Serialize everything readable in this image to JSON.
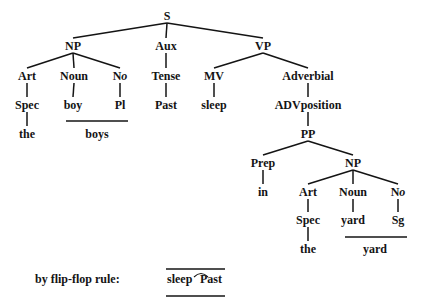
{
  "tree": {
    "nodes": [
      {
        "id": "S",
        "label": "S",
        "x": 167,
        "y": 20
      },
      {
        "id": "NP1",
        "label": "NP",
        "x": 73,
        "y": 50
      },
      {
        "id": "Aux",
        "label": "Aux",
        "x": 166,
        "y": 50
      },
      {
        "id": "VP",
        "label": "VP",
        "x": 263,
        "y": 50
      },
      {
        "id": "Art1",
        "label": "Art",
        "x": 27,
        "y": 80
      },
      {
        "id": "Noun1",
        "label": "Noun",
        "x": 74,
        "y": 80
      },
      {
        "id": "No1",
        "label": "No",
        "x": 120,
        "y": 80,
        "italic_o": true
      },
      {
        "id": "Tense",
        "label": "Tense",
        "x": 166,
        "y": 80
      },
      {
        "id": "MV",
        "label": "MV",
        "x": 214,
        "y": 80
      },
      {
        "id": "Adverbial",
        "label": "Adverbial",
        "x": 308,
        "y": 80
      },
      {
        "id": "Spec1",
        "label": "Spec",
        "x": 27,
        "y": 109
      },
      {
        "id": "boy",
        "label": "boy",
        "x": 73,
        "y": 109
      },
      {
        "id": "Pl",
        "label": "Pl",
        "x": 120,
        "y": 109
      },
      {
        "id": "Past",
        "label": "Past",
        "x": 166,
        "y": 109
      },
      {
        "id": "sleep",
        "label": "sleep",
        "x": 214,
        "y": 109
      },
      {
        "id": "ADVposition",
        "label": "ADVposition",
        "x": 308,
        "y": 109
      },
      {
        "id": "the1",
        "label": "the",
        "x": 27,
        "y": 138
      },
      {
        "id": "PP",
        "label": "PP",
        "x": 308,
        "y": 138
      },
      {
        "id": "Prep",
        "label": "Prep",
        "x": 263,
        "y": 167
      },
      {
        "id": "NP2",
        "label": "NP",
        "x": 353,
        "y": 167
      },
      {
        "id": "in",
        "label": "in",
        "x": 263,
        "y": 196
      },
      {
        "id": "Art2",
        "label": "Art",
        "x": 308,
        "y": 196
      },
      {
        "id": "Noun2",
        "label": "Noun",
        "x": 353,
        "y": 196
      },
      {
        "id": "No2",
        "label": "No",
        "x": 398,
        "y": 196,
        "italic_o": true
      },
      {
        "id": "Spec2",
        "label": "Spec",
        "x": 308,
        "y": 224
      },
      {
        "id": "yard1",
        "label": "yard",
        "x": 353,
        "y": 224
      },
      {
        "id": "Sg",
        "label": "Sg",
        "x": 398,
        "y": 224
      },
      {
        "id": "the2",
        "label": "the",
        "x": 308,
        "y": 253
      }
    ],
    "edges": [
      [
        "S",
        "NP1"
      ],
      [
        "S",
        "Aux"
      ],
      [
        "S",
        "VP"
      ],
      [
        "NP1",
        "Art1"
      ],
      [
        "NP1",
        "Noun1"
      ],
      [
        "NP1",
        "No1"
      ],
      [
        "Aux",
        "Tense"
      ],
      [
        "VP",
        "MV"
      ],
      [
        "VP",
        "Adverbial"
      ],
      [
        "Art1",
        "Spec1"
      ],
      [
        "Noun1",
        "boy"
      ],
      [
        "No1",
        "Pl"
      ],
      [
        "Tense",
        "Past"
      ],
      [
        "MV",
        "sleep"
      ],
      [
        "Adverbial",
        "ADVposition"
      ],
      [
        "Spec1",
        "the1"
      ],
      [
        "ADVposition",
        "PP"
      ],
      [
        "PP",
        "Prep"
      ],
      [
        "PP",
        "NP2"
      ],
      [
        "Prep",
        "in"
      ],
      [
        "NP2",
        "Art2"
      ],
      [
        "NP2",
        "Noun2"
      ],
      [
        "NP2",
        "No2"
      ],
      [
        "Art2",
        "Spec2"
      ],
      [
        "Noun2",
        "yard1"
      ],
      [
        "No2",
        "Sg"
      ],
      [
        "Spec2",
        "the2"
      ]
    ],
    "combined_forms": [
      {
        "label": "boys",
        "bar_x1": 66,
        "bar_x2": 128,
        "bar_y": 121,
        "text_x": 97,
        "text_y": 138
      },
      {
        "label": "yard",
        "bar_x1": 345,
        "bar_x2": 407,
        "bar_y": 237,
        "text_x": 375,
        "text_y": 253
      }
    ]
  },
  "flip_flop": {
    "caption": "by flip-flop rule:",
    "word1": "sleep",
    "word2": "Past",
    "caption_x": 35,
    "y": 283
  }
}
